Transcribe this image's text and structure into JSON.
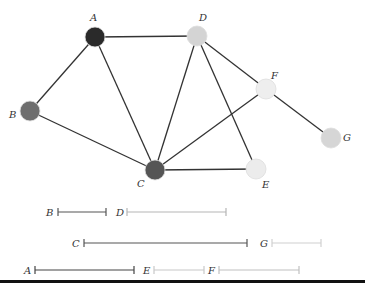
{
  "graph": {
    "nodes": [
      {
        "id": "A",
        "x": 95,
        "y": 37,
        "fill": "#2a2a2a",
        "lx": 90,
        "ly": 21
      },
      {
        "id": "B",
        "x": 30,
        "y": 111,
        "fill": "#6e6e6e",
        "lx": 9,
        "ly": 118
      },
      {
        "id": "C",
        "x": 155,
        "y": 170,
        "fill": "#555555",
        "lx": 137,
        "ly": 187
      },
      {
        "id": "D",
        "x": 197,
        "y": 36,
        "fill": "#d4d4d4",
        "lx": 199,
        "ly": 21
      },
      {
        "id": "E",
        "x": 256,
        "y": 169,
        "fill": "#ececec",
        "lx": 262,
        "ly": 188
      },
      {
        "id": "F",
        "x": 266,
        "y": 89,
        "fill": "#eeeeee",
        "lx": 271,
        "ly": 79
      },
      {
        "id": "G",
        "x": 331,
        "y": 138,
        "fill": "#d6d6d6",
        "lx": 343,
        "ly": 141
      }
    ],
    "edges": [
      [
        "A",
        "D"
      ],
      [
        "A",
        "B"
      ],
      [
        "A",
        "C"
      ],
      [
        "B",
        "C"
      ],
      [
        "C",
        "D"
      ],
      [
        "C",
        "F"
      ],
      [
        "C",
        "E"
      ],
      [
        "D",
        "E"
      ],
      [
        "D",
        "F"
      ],
      [
        "F",
        "G"
      ]
    ]
  },
  "intervals": [
    {
      "id": "B",
      "x1": 58,
      "x2": 106,
      "y": 212,
      "color": "#555555",
      "lx": 46
    },
    {
      "id": "D",
      "x1": 127,
      "x2": 226,
      "y": 212,
      "color": "#b5b5b5",
      "lx": 116
    },
    {
      "id": "C",
      "x1": 84,
      "x2": 247,
      "y": 243,
      "color": "#555555",
      "lx": 72
    },
    {
      "id": "G",
      "x1": 272,
      "x2": 321,
      "y": 243,
      "color": "#d0d0d0",
      "lx": 260
    },
    {
      "id": "A",
      "x1": 35,
      "x2": 134,
      "y": 270,
      "color": "#444444",
      "lx": 24
    },
    {
      "id": "E",
      "x1": 154,
      "x2": 204,
      "y": 270,
      "color": "#c8c8c8",
      "lx": 143
    },
    {
      "id": "F",
      "x1": 219,
      "x2": 299,
      "y": 270,
      "color": "#c0c0c0",
      "lx": 208
    }
  ]
}
